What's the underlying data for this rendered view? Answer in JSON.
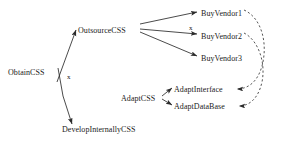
{
  "diagram": {
    "title": "",
    "type": "goal-refinement-graph",
    "background_color": "#ffffff",
    "line_color": "#2b2b2b",
    "text_color": "#1a1a1a",
    "nodes": [
      {
        "id": "obtain",
        "label": "ObtainCSS",
        "x": 8,
        "y": 68
      },
      {
        "id": "outsource",
        "label": "OutsourceCSS",
        "x": 78,
        "y": 26
      },
      {
        "id": "develop",
        "label": "DevelopInternallyCSS",
        "x": 62,
        "y": 125
      },
      {
        "id": "vendor1",
        "label": "BuyVendor1",
        "x": 201,
        "y": 9
      },
      {
        "id": "vendor2",
        "label": "BuyVendor2",
        "x": 201,
        "y": 32
      },
      {
        "id": "vendor3",
        "label": "BuyVendor3",
        "x": 201,
        "y": 54
      },
      {
        "id": "adapt",
        "label": "AdaptCSS",
        "x": 121,
        "y": 94
      },
      {
        "id": "adaptiface",
        "label": "AdaptInterface",
        "x": 174,
        "y": 85
      },
      {
        "id": "adaptdb",
        "label": "AdaptDataBase",
        "x": 174,
        "y": 102
      }
    ],
    "edge_labels": [
      {
        "id": "deny-develop",
        "label": "x",
        "x": 67,
        "y": 73
      },
      {
        "id": "deny-vendor2",
        "label": "x",
        "x": 189,
        "y": 24
      }
    ],
    "edges": [
      {
        "from": "obtain",
        "to": "outsource",
        "style": "solid",
        "arrow": "target"
      },
      {
        "from": "obtain",
        "to": "develop",
        "style": "solid",
        "arrow": "target"
      },
      {
        "from": "outsource",
        "to": "vendor1",
        "style": "solid",
        "arrow": "target"
      },
      {
        "from": "outsource",
        "to": "vendor2",
        "style": "solid",
        "arrow": "target"
      },
      {
        "from": "outsource",
        "to": "vendor3",
        "style": "solid",
        "arrow": "target"
      },
      {
        "from": "adapt",
        "to": "adaptiface",
        "style": "solid",
        "arrow": "target"
      },
      {
        "from": "adapt",
        "to": "adaptdb",
        "style": "solid",
        "arrow": "target"
      },
      {
        "from": "vendor1",
        "to": "adaptiface",
        "style": "dashed",
        "arrow": "target"
      },
      {
        "from": "vendor2",
        "to": "adaptdb",
        "style": "dashed",
        "arrow": "target"
      }
    ]
  }
}
